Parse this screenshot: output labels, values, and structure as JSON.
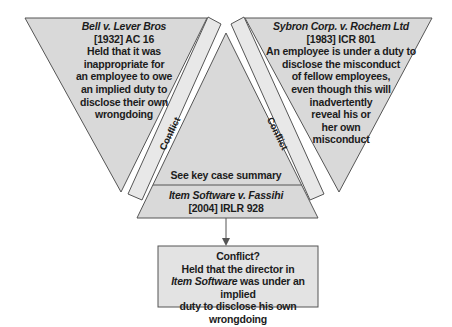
{
  "left_case": {
    "name": "Bell v. Lever Bros",
    "name_plain_part": "Bell",
    "name_italic_part": " v. Lever Bros",
    "citation": "[1932] AC 16",
    "holding_lines": [
      "Held that it was",
      "inappropriate for",
      "an employee to owe",
      "an implied duty to",
      "disclose their own",
      "wrongdoing"
    ]
  },
  "right_case": {
    "name": "Sybron Corp. v. Rochem Ltd",
    "citation": "[1983] ICR 801",
    "holding_lines": [
      "An employee is under a duty to",
      "disclose the misconduct",
      "of fellow employees,",
      "even though this will",
      "inadvertently",
      "reveal his or",
      "her own",
      "misconduct"
    ]
  },
  "left_band_label": "Conflict",
  "right_band_label": "Conflict",
  "center": {
    "summary_label": "See key case summary",
    "case_name": "Item Software v. Fassihi",
    "citation": "[2004] IRLR 928"
  },
  "result_box": {
    "title": "Conflict?",
    "line1": "Held that the director in",
    "line2_italic": "Item Software",
    "line2_rest": " was under an implied",
    "line3": "duty to disclose his own wrongdoing"
  },
  "colors": {
    "fill": "#d9d9d9",
    "band_fill": "#e6e6e6",
    "stroke": "#555555",
    "box_fill": "#e3e3e3"
  }
}
